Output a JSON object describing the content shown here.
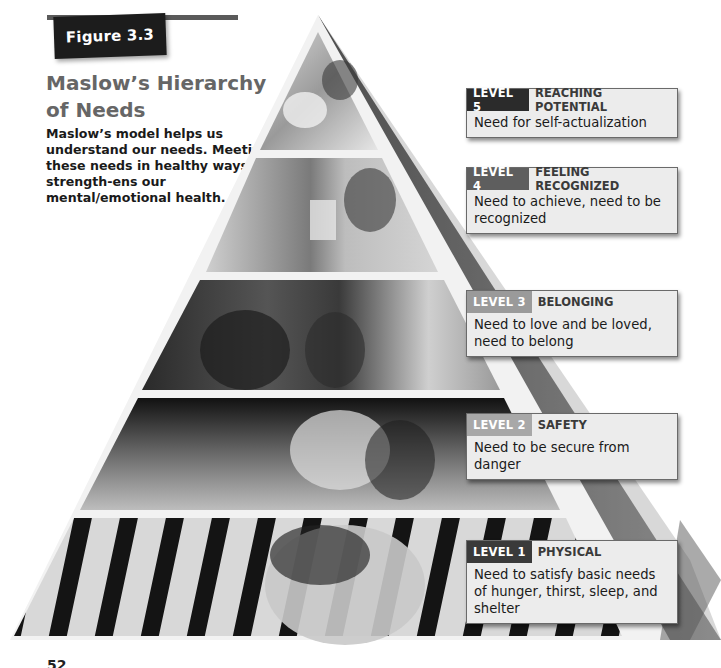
{
  "figure": {
    "tag": "Figure 3.3",
    "title": "Maslow’s Hierarchy of Needs",
    "description": "Maslow’s model helps us understand our needs. Meeting these needs in healthy ways strength-ens our mental/emotional health."
  },
  "pyramid": {
    "tiers": [
      {
        "level": 5,
        "photo": "woman-with-dog-photo"
      },
      {
        "level": 4,
        "photo": "student-with-trophy-photo"
      },
      {
        "level": 3,
        "photo": "family-photo"
      },
      {
        "level": 2,
        "photo": "father-holding-baby-photo"
      },
      {
        "level": 1,
        "photo": "baby-in-crib-photo"
      }
    ]
  },
  "levels": [
    {
      "number": "LEVEL 5",
      "name": "REACHING POTENTIAL",
      "text": "Need for self-actualization",
      "badge_color": "#2b2b2b"
    },
    {
      "number": "LEVEL 4",
      "name": "FEELING RECOGNIZED",
      "text": "Need to achieve, need to be recognized",
      "badge_color": "#5e5e5e"
    },
    {
      "number": "LEVEL 3",
      "name": "BELONGING",
      "text": "Need to love and be loved, need to belong",
      "badge_color": "#9a9a9a"
    },
    {
      "number": "LEVEL 2",
      "name": "SAFETY",
      "text": "Need to be secure from danger",
      "badge_color": "#a8a8a8"
    },
    {
      "number": "LEVEL 1",
      "name": "PHYSICAL",
      "text": "Need to satisfy basic needs of hunger, thirst, sleep, and shelter",
      "badge_color": "#3a3a3a"
    }
  ],
  "page_number": "52"
}
